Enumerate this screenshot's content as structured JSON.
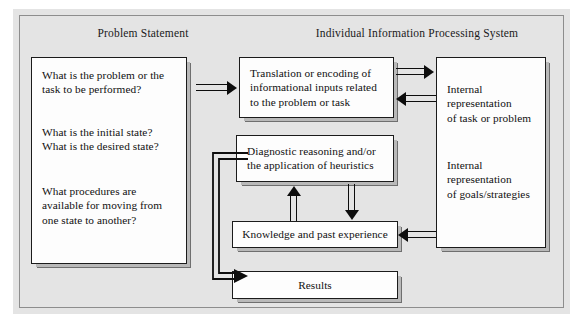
{
  "figure": {
    "background_color": "#ffffff",
    "panel_color": "#e4e4e4",
    "box_fill": "#fdfdfd",
    "line_color": "#0d0d0d",
    "shadow_color": "#6f6f6f"
  },
  "headings": {
    "left": "Problem Statement",
    "right": "Individual Information Processing System"
  },
  "boxes": {
    "problem_statement": {
      "questions": [
        "What is the problem or the task to be performed?",
        "What is the initial state? What is the desired state?",
        "What procedures are available for moving from one state to another?"
      ],
      "lines": [
        [
          "What is the problem or the",
          "task to be performed?"
        ],
        [
          "What is the initial state?",
          "What is the desired state?"
        ],
        [
          "What procedures are",
          "available for moving from",
          "one state to another?"
        ]
      ]
    },
    "translation": {
      "label": "Translation or encoding of informational inputs related to the problem or task",
      "lines": [
        "Translation or encoding of",
        "informational inputs related",
        "to the problem or task"
      ]
    },
    "diagnostic": {
      "label": "Diagnostic reasoning and/or the application of heuristics",
      "lines": [
        "Diagnostic reasoning and/or",
        "the application of heuristics"
      ]
    },
    "knowledge": {
      "label": "Knowledge and past experience"
    },
    "results": {
      "label": "Results"
    },
    "internal_representation": {
      "task_or_problem": {
        "label": "Internal representation of task or problem",
        "lines": [
          "Internal",
          "representation",
          "of task or problem"
        ]
      },
      "goals_strategies": {
        "label": "Internal representation of goals/strategies",
        "lines": [
          "Internal",
          "representation",
          "of goals/strategies"
        ]
      }
    }
  },
  "arrows": [
    {
      "name": "problem-statement-to-translation",
      "from": "Problem Statement",
      "to": "Translation or encoding",
      "direction": "right"
    },
    {
      "name": "translation-to-internal-representation",
      "from": "Translation or encoding",
      "to": "Internal representation of task or problem",
      "direction": "right"
    },
    {
      "name": "internal-representation-to-translation",
      "from": "Internal representation of task or problem",
      "to": "Translation or encoding",
      "direction": "left"
    },
    {
      "name": "internal-representation-to-knowledge",
      "from": "Internal representation of goals/strategies",
      "to": "Knowledge and past experience",
      "direction": "left"
    },
    {
      "name": "knowledge-to-diagnostic",
      "from": "Knowledge and past experience",
      "to": "Diagnostic reasoning and/or the application of heuristics",
      "direction": "up"
    },
    {
      "name": "diagnostic-to-knowledge",
      "from": "Diagnostic reasoning and/or the application of heuristics",
      "to": "Knowledge and past experience",
      "direction": "down"
    },
    {
      "name": "diagnostic-to-results",
      "from": "Diagnostic reasoning and/or the application of heuristics",
      "to": "Results",
      "direction": "elbow-down-right"
    }
  ]
}
